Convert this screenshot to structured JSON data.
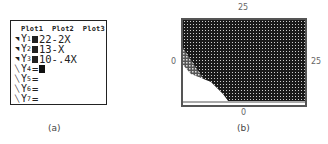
{
  "panel_a": {
    "plot_header": "Plot1  Plot2  Plot3",
    "functions": [
      {
        "name": "Y",
        "index": "1",
        "selected": true,
        "expr": "22-2X"
      },
      {
        "name": "Y",
        "index": "2",
        "selected": true,
        "expr": "13-X"
      },
      {
        "name": "Y",
        "index": "3",
        "selected": true,
        "expr": "10-.4X"
      },
      {
        "name": "Y",
        "index": "4",
        "selected": false,
        "expr": ""
      },
      {
        "name": "Y",
        "index": "5",
        "selected": false,
        "expr": ""
      },
      {
        "name": "Y",
        "index": "6",
        "selected": false,
        "expr": ""
      },
      {
        "name": "Y",
        "index": "7",
        "selected": false,
        "expr": ""
      }
    ],
    "caption": "(a)"
  },
  "panel_b": {
    "ymax_label": "25",
    "xmin_label": "0",
    "xmax_label": "25",
    "ymin_label": "0",
    "caption": "(b)",
    "colors": {
      "shade_dark": "#1a1a1a",
      "frame": "#555555"
    }
  }
}
